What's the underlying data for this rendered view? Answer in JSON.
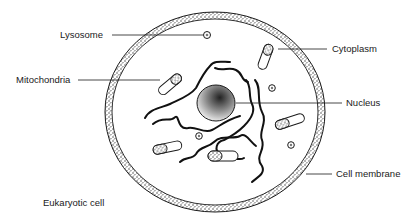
{
  "diagram": {
    "title": "Eukaryotic cell",
    "labels": [
      {
        "id": "lysosome",
        "text": "Lysosome"
      },
      {
        "id": "mitochondria",
        "text": "Mitochondria"
      },
      {
        "id": "cytoplasm",
        "text": "Cytoplasm"
      },
      {
        "id": "nucleus",
        "text": "Nucleus"
      },
      {
        "id": "cell-membrane",
        "text": "Cell membrane"
      }
    ],
    "colors": {
      "ink": "#1a1a1a",
      "background": "#ffffff",
      "stipple": "#555555"
    }
  }
}
